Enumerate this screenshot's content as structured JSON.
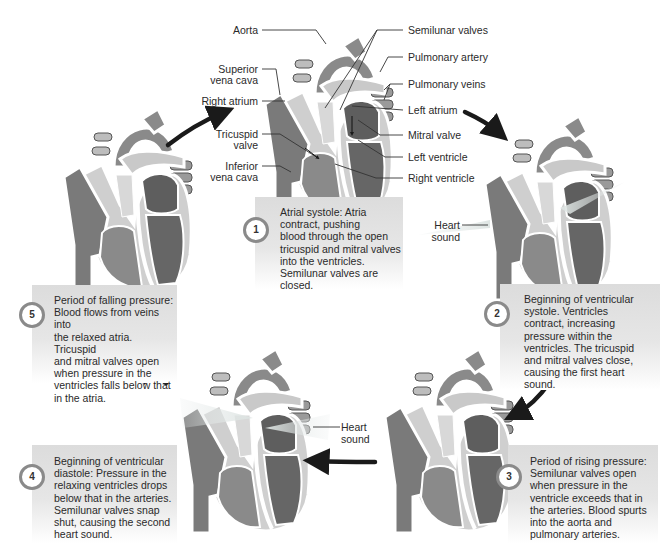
{
  "colors": {
    "deoxygenated_blood": "#6e6e6e",
    "oxygenated_blood": "#555555",
    "vessel_wall": "#ffffff",
    "light_chamber": "#b9b9b9",
    "caption_bg": "#e0e0e0",
    "arrow": "#1a1a1a"
  },
  "main_heart": {
    "labels_left": [
      "Aorta",
      "Superior vena cava",
      "Right atrium",
      "Tricuspid valve",
      "Inferior vena cava"
    ],
    "labels_right": [
      "Semilunar valves",
      "Pulmonary artery",
      "Pulmonary veins",
      "Left atrium",
      "Mitral valve",
      "Left ventricle",
      "Right ventricle"
    ],
    "aorta": "Aorta",
    "superior_vena_cava_1": "Superior",
    "superior_vena_cava_2": "vena cava",
    "right_atrium": "Right atrium",
    "tricuspid_1": "Tricuspid",
    "tricuspid_2": "valve",
    "inferior_vena_cava_1": "Inferior",
    "inferior_vena_cava_2": "vena cava",
    "semilunar_valves": "Semilunar valves",
    "pulmonary_artery": "Pulmonary artery",
    "pulmonary_veins": "Pulmonary veins",
    "left_atrium": "Left atrium",
    "mitral_valve": "Mitral valve",
    "left_ventricle": "Left ventricle",
    "right_ventricle": "Right ventricle"
  },
  "heart_sound": {
    "line1": "Heart",
    "line2": "sound"
  },
  "phases": [
    {
      "number": "1",
      "lines": [
        "Atrial systole: Atria",
        "contract, pushing",
        "blood through the open",
        "tricuspid and mitral valves",
        "into the ventricles.",
        "Semilunar valves are",
        "closed."
      ]
    },
    {
      "number": "2",
      "lines": [
        "Beginning of ventricular",
        "systole. Ventricles",
        "contract, increasing",
        "pressure within the",
        "ventricles. The tricuspid",
        "and mitral valves close,",
        "causing the first heart",
        "sound."
      ]
    },
    {
      "number": "3",
      "lines": [
        "Period of rising pressure:",
        "Semilunar valves open",
        "when pressure in the",
        "ventricle exceeds that in",
        "the arteries. Blood spurts",
        "into the aorta and",
        "pulmonary arteries."
      ]
    },
    {
      "number": "4",
      "lines": [
        "Beginning of ventricular",
        "diastole: Pressure in the",
        "relaxing ventricles drops",
        "below that in the arteries.",
        "Semilunar valves snap",
        "shut, causing the second",
        "heart sound."
      ]
    },
    {
      "number": "5",
      "lines": [
        "Period of falling pressure:",
        "Blood flows from veins into",
        "the relaxed atria. Tricuspid",
        "and mitral valves open",
        "when pressure in the",
        "ventricles falls below that",
        "in the atria."
      ]
    }
  ]
}
